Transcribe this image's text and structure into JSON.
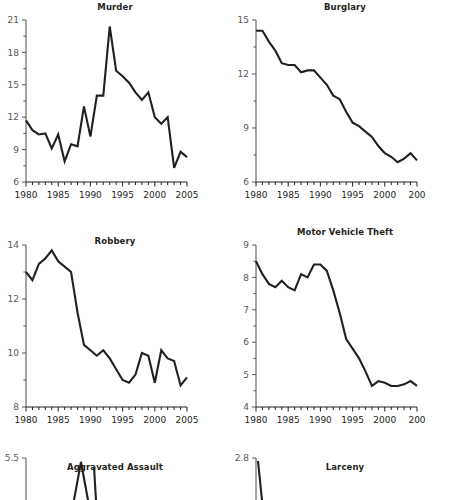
{
  "figure": {
    "name": "us-crime-rate-small-multiples",
    "panel_count_visible": 6,
    "panels_clipped_right": [
      "Burglary",
      "Motor Vehicle Theft"
    ],
    "panels_clipped_bottom": [
      "Aggravated Assault",
      "Larceny"
    ]
  },
  "chart_data": [
    {
      "type": "line",
      "title": "Murder",
      "xlabel": "",
      "ylabel": "",
      "x": [
        1980,
        1981,
        1982,
        1983,
        1984,
        1985,
        1986,
        1987,
        1988,
        1989,
        1990,
        1991,
        1992,
        1993,
        1994,
        1995,
        1996,
        1997,
        1998,
        1999,
        2000,
        2001,
        2002,
        2003,
        2004,
        2005
      ],
      "values": [
        11.7,
        10.8,
        10.4,
        10.5,
        9.1,
        10.4,
        7.9,
        9.5,
        9.3,
        13.0,
        10.2,
        14.0,
        14.0,
        20.4,
        16.3,
        15.8,
        15.2,
        14.3,
        13.6,
        14.3,
        12.0,
        11.4,
        12.0,
        7.3,
        8.8,
        8.3
      ],
      "series": [
        {
          "name": "Murder rate",
          "values": [
            11.7,
            10.8,
            10.4,
            10.5,
            9.1,
            10.4,
            7.9,
            9.5,
            9.3,
            13.0,
            10.2,
            14.0,
            14.0,
            20.4,
            16.3,
            15.8,
            15.2,
            14.3,
            13.6,
            14.3,
            12.0,
            11.4,
            12.0,
            7.3,
            8.8,
            8.3
          ]
        }
      ],
      "ylim": [
        6,
        21
      ],
      "yticks": [
        6,
        9,
        12,
        15,
        18,
        21
      ],
      "ytick_labels": [
        "6",
        "9",
        "12",
        "15",
        "18",
        "21"
      ],
      "xlim": [
        1980,
        2005
      ],
      "xticks": [
        1980,
        1985,
        1990,
        1995,
        2000,
        2005
      ],
      "xtick_labels": [
        "1980",
        "1985",
        "1990",
        "1995",
        "2000",
        "2005"
      ],
      "minor_xticks": true,
      "grid": false,
      "legend": "none",
      "clipped": false
    },
    {
      "type": "line",
      "title": "Burglary",
      "xlabel": "",
      "ylabel": "",
      "x": [
        1980,
        1981,
        1982,
        1983,
        1984,
        1985,
        1986,
        1987,
        1988,
        1989,
        1990,
        1991,
        1992,
        1993,
        1994,
        1995,
        1996,
        1997,
        1998,
        1999,
        2000,
        2001,
        2002,
        2003,
        2004,
        2005
      ],
      "values": [
        14.4,
        14.4,
        13.8,
        13.3,
        12.6,
        12.5,
        12.5,
        12.1,
        12.2,
        12.2,
        11.8,
        11.4,
        10.8,
        10.6,
        9.9,
        9.3,
        9.1,
        8.8,
        8.5,
        8.0,
        7.6,
        7.4,
        7.1,
        7.3,
        7.6,
        7.2
      ],
      "series": [
        {
          "name": "Burglary rate",
          "values": [
            14.4,
            14.4,
            13.8,
            13.3,
            12.6,
            12.5,
            12.5,
            12.1,
            12.2,
            12.2,
            11.8,
            11.4,
            10.8,
            10.6,
            9.9,
            9.3,
            9.1,
            8.8,
            8.5,
            8.0,
            7.6,
            7.4,
            7.1,
            7.3,
            7.6,
            7.2
          ]
        }
      ],
      "ylim": [
        6,
        15
      ],
      "yticks": [
        6,
        9,
        12,
        15
      ],
      "ytick_labels": [
        "6",
        "9",
        "12",
        "15"
      ],
      "xlim": [
        1980,
        2005
      ],
      "xticks": [
        1980,
        1985,
        1990,
        1995,
        2000,
        2005
      ],
      "xtick_labels": [
        "1980",
        "1985",
        "1990",
        "1995",
        "2000",
        "200"
      ],
      "minor_xticks": true,
      "grid": false,
      "legend": "none",
      "clipped": true
    },
    {
      "type": "line",
      "title": "Robbery",
      "xlabel": "",
      "ylabel": "",
      "x": [
        1980,
        1981,
        1982,
        1983,
        1984,
        1985,
        1986,
        1987,
        1988,
        1989,
        1990,
        1991,
        1992,
        1993,
        1994,
        1995,
        1996,
        1997,
        1998,
        1999,
        2000,
        2001,
        2002,
        2003,
        2004,
        2005
      ],
      "values": [
        13.0,
        12.7,
        13.3,
        13.5,
        13.8,
        13.4,
        13.2,
        13.0,
        11.5,
        10.3,
        10.1,
        9.9,
        10.1,
        9.8,
        9.4,
        9.0,
        8.9,
        9.2,
        10.0,
        9.9,
        8.9,
        10.1,
        9.8,
        9.7,
        8.8,
        9.1
      ],
      "series": [
        {
          "name": "Robbery rate",
          "values": [
            13.0,
            12.7,
            13.3,
            13.5,
            13.8,
            13.4,
            13.2,
            13.0,
            11.5,
            10.3,
            10.1,
            9.9,
            10.1,
            9.8,
            9.4,
            9.0,
            8.9,
            9.2,
            10.0,
            9.9,
            8.9,
            10.1,
            9.8,
            9.7,
            8.8,
            9.1
          ]
        }
      ],
      "ylim": [
        8,
        14
      ],
      "yticks": [
        8,
        10,
        12,
        14
      ],
      "ytick_labels": [
        "8",
        "10",
        "12",
        "14"
      ],
      "xlim": [
        1980,
        2005
      ],
      "xticks": [
        1980,
        1985,
        1990,
        1995,
        2000,
        2005
      ],
      "xtick_labels": [
        "1980",
        "1985",
        "1990",
        "1995",
        "2000",
        "2005"
      ],
      "minor_xticks": true,
      "grid": false,
      "legend": "none",
      "clipped": false
    },
    {
      "type": "line",
      "title": "Motor Vehicle Theft",
      "xlabel": "",
      "ylabel": "",
      "x": [
        1980,
        1981,
        1982,
        1983,
        1984,
        1985,
        1986,
        1987,
        1988,
        1989,
        1990,
        1991,
        1992,
        1993,
        1994,
        1995,
        1996,
        1997,
        1998,
        1999,
        2000,
        2001,
        2002,
        2003,
        2004,
        2005
      ],
      "values": [
        8.5,
        8.1,
        7.8,
        7.7,
        7.9,
        7.7,
        7.6,
        8.1,
        8.0,
        8.4,
        8.4,
        8.2,
        7.6,
        6.9,
        6.1,
        5.8,
        5.5,
        5.1,
        4.65,
        4.8,
        4.75,
        4.65,
        4.65,
        4.7,
        4.8,
        4.65
      ],
      "series": [
        {
          "name": "Motor vehicle theft rate",
          "values": [
            8.5,
            8.1,
            7.8,
            7.7,
            7.9,
            7.7,
            7.6,
            8.1,
            8.0,
            8.4,
            8.4,
            8.2,
            7.6,
            6.9,
            6.1,
            5.8,
            5.5,
            5.1,
            4.65,
            4.8,
            4.75,
            4.65,
            4.65,
            4.7,
            4.8,
            4.65
          ]
        }
      ],
      "ylim": [
        4,
        9
      ],
      "yticks": [
        4,
        5,
        6,
        7,
        8,
        9
      ],
      "ytick_labels": [
        "4",
        "5",
        "6",
        "7",
        "8",
        "9"
      ],
      "xlim": [
        1980,
        2005
      ],
      "xticks": [
        1980,
        1985,
        1990,
        1995,
        2000,
        2005
      ],
      "xtick_labels": [
        "1980",
        "1985",
        "1990",
        "1995",
        "2000",
        "200"
      ],
      "minor_xticks": true,
      "grid": false,
      "legend": "none",
      "clipped": true
    },
    {
      "type": "line",
      "title": "Aggravated Assault",
      "xlabel": "",
      "ylabel": "",
      "x": [],
      "values": [],
      "series": [
        {
          "name": "Aggravated assault rate",
          "values": []
        }
      ],
      "ylim": [
        null,
        5.5
      ],
      "yticks": [
        5.5
      ],
      "ytick_labels": [
        "5.5"
      ],
      "xticks": [],
      "xtick_labels": [],
      "grid": false,
      "legend": "none",
      "clipped": true,
      "note": "panel cut off at bottom edge of image; only title and top y-tick visible"
    },
    {
      "type": "line",
      "title": "Larceny",
      "xlabel": "",
      "ylabel": "",
      "x": [],
      "values": [],
      "series": [
        {
          "name": "Larceny rate",
          "values": []
        }
      ],
      "ylim": [
        null,
        2.8
      ],
      "yticks": [
        2.8
      ],
      "ytick_labels": [
        "2.8"
      ],
      "xticks": [],
      "xtick_labels": [],
      "grid": false,
      "legend": "none",
      "clipped": true,
      "note": "panel cut off at bottom edge of image; only title and top y-tick visible"
    }
  ],
  "colors": {
    "line": "#231f20",
    "axis": "#58595b",
    "xaxis": "#231f20",
    "title": "#231f20",
    "ytick_text": "#58595b",
    "xtick_text": "#231f20",
    "background": "#ffffff"
  }
}
